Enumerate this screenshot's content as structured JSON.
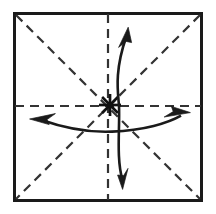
{
  "figure": {
    "title": "Origami fold diagram: square sheet with pre-creased diagonals and mid-lines",
    "caption": "",
    "background_color": "#ffffff",
    "ink_color": "#1a1a1a",
    "crease_color": "#333333",
    "width": 216,
    "height": 214
  },
  "sheet": {
    "name": "paper-square",
    "description": "Square sheet of paper seen face-on",
    "left": 13,
    "top": 12,
    "right": 203,
    "bottom": 202,
    "stroke_width": 3,
    "fill": "#ffffff",
    "stroke": "#1a1a1a"
  },
  "creases": [
    {
      "id": "crease-vertical",
      "label": "Vertical mid-line crease",
      "orientation": "vertical",
      "x1": 108,
      "y1": 14,
      "x2": 108,
      "y2": 200,
      "style": "dashed",
      "dash": "9 6",
      "stroke_width": 2.2
    },
    {
      "id": "crease-horizontal",
      "label": "Horizontal mid-line crease",
      "orientation": "horizontal",
      "x1": 15,
      "y1": 106,
      "x2": 201,
      "y2": 106,
      "style": "dashed",
      "dash": "9 6",
      "stroke_width": 2.2
    },
    {
      "id": "crease-diagonal-tlbr",
      "label": "Diagonal crease top-left to bottom-right",
      "orientation": "diagonal",
      "x1": 16,
      "y1": 15,
      "x2": 200,
      "y2": 199,
      "style": "dashed",
      "dash": "9 6",
      "stroke_width": 2.2
    },
    {
      "id": "crease-diagonal-trbl",
      "label": "Diagonal crease top-right to bottom-left",
      "orientation": "diagonal",
      "x1": 200,
      "y1": 15,
      "x2": 16,
      "y2": 199,
      "style": "dashed",
      "dash": "9 6",
      "stroke_width": 2.2
    }
  ],
  "center_mark": {
    "id": "center-starburst",
    "label": "Center point starburst mark",
    "cx": 110,
    "cy": 105,
    "ray_count": 8,
    "ray_length": 11,
    "stroke_width": 2.4
  },
  "arrows": [
    {
      "id": "arrow-vertical",
      "label": "Double-headed curved arrow along the vertical axis",
      "axis": "vertical",
      "path": "M 128 34 C 114 72, 118 92, 119 105 C 120 126, 116 158, 123 182",
      "stroke_width": 2.6,
      "head_start": {
        "tip_x": 128,
        "tip_y": 27,
        "direction": "up"
      },
      "head_end": {
        "tip_x": 123,
        "tip_y": 189,
        "direction": "down"
      }
    },
    {
      "id": "arrow-horizontal",
      "label": "Double-headed curved arrow along the horizontal axis",
      "axis": "horizontal",
      "path": "M 38 119 C 72 130, 96 132, 112 131 C 144 130, 168 123, 182 116",
      "stroke_width": 2.6,
      "head_start": {
        "tip_x": 30,
        "tip_y": 119,
        "direction": "left"
      },
      "head_end": {
        "tip_x": 190,
        "tip_y": 113,
        "direction": "right"
      }
    }
  ],
  "legend": {
    "dashed_line_meaning": "valley/mountain pre-crease",
    "arrow_meaning": "fold direction",
    "starburst_meaning": "center reference point"
  }
}
